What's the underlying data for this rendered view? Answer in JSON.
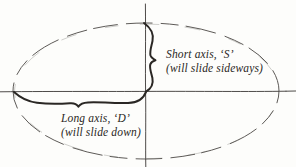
{
  "figure": {
    "background_color": "#fdfdfb",
    "ink_color": "#2a2724",
    "dashed_color": "#5d5a57",
    "annotations": {
      "short_axis": {
        "line1": "Short axis, ‘S’",
        "line2": "(will slide sideways)"
      },
      "long_axis": {
        "line1": "Long axis, ‘D’",
        "line2": "(will slide down)"
      }
    },
    "elements": {
      "ellipse_name": "dashed-ellipse",
      "horizontal_axis_name": "horizontal-axis-line",
      "vertical_axis_name": "vertical-axis-line",
      "short_curve_name": "short-axis-curve",
      "long_curve_name": "long-axis-curve"
    }
  }
}
